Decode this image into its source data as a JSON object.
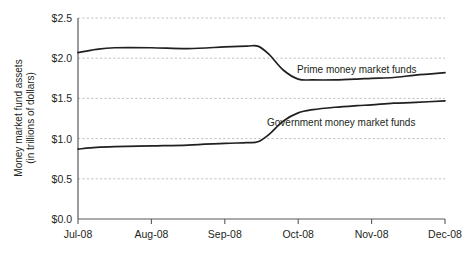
{
  "chart_data": {
    "type": "line",
    "title": "",
    "xlabel": "",
    "ylabel": "Money market fund assets (in trillions of dollars)",
    "ylabel_line1": "Money market fund assets",
    "ylabel_line2": "(in trillions of dollars)",
    "ylim": [
      0.0,
      2.5
    ],
    "ytick_labels": [
      "$2.5",
      "$2.0",
      "$1.5",
      "$1.0",
      "$0.5",
      "$0.0"
    ],
    "ytick_values": [
      2.5,
      2.0,
      1.5,
      1.0,
      0.5,
      0.0
    ],
    "categories": [
      "Jul-08",
      "Aug-08",
      "Sep-08",
      "Oct-08",
      "Nov-08",
      "Dec-08"
    ],
    "xtick_labels": [
      "Jul-08",
      "Aug-08",
      "Sep-08",
      "Oct-08",
      "Nov-08",
      "Dec-08"
    ],
    "grid": "horizontal-dashed",
    "legend_position": "inline-annotations",
    "line_color": "#231f20",
    "grid_color": "#b9b9b9",
    "axis_color": "#58595b",
    "background_color": "#ffffff",
    "series": [
      {
        "name": "Prime money market funds",
        "annotation": "Prime money market funds",
        "x": [
          0.0,
          0.25,
          0.5,
          1.0,
          1.5,
          2.0,
          2.3,
          2.45,
          2.6,
          2.8,
          3.0,
          3.2,
          3.5,
          3.8,
          4.0,
          4.3,
          4.6,
          5.0
        ],
        "values": [
          2.07,
          2.11,
          2.13,
          2.13,
          2.12,
          2.14,
          2.15,
          2.15,
          2.05,
          1.85,
          1.74,
          1.73,
          1.73,
          1.74,
          1.75,
          1.76,
          1.79,
          1.82
        ]
      },
      {
        "name": "Government money market funds",
        "annotation": "Government money market funds",
        "x": [
          0.0,
          0.25,
          0.5,
          1.0,
          1.5,
          2.0,
          2.3,
          2.45,
          2.6,
          2.8,
          3.0,
          3.2,
          3.5,
          3.8,
          4.0,
          4.3,
          4.6,
          5.0
        ],
        "values": [
          0.87,
          0.89,
          0.9,
          0.91,
          0.92,
          0.94,
          0.95,
          0.96,
          1.05,
          1.22,
          1.32,
          1.36,
          1.39,
          1.41,
          1.42,
          1.44,
          1.45,
          1.47
        ]
      }
    ]
  }
}
